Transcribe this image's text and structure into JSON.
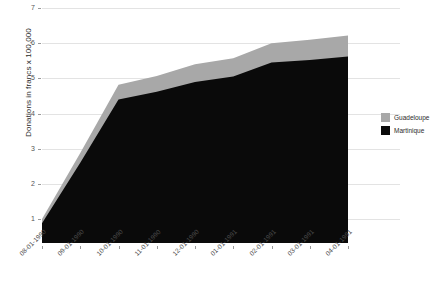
{
  "chart_data": {
    "type": "area",
    "stacked": true,
    "title": "",
    "xlabel": "",
    "ylabel": "Donations in francs x 100,000",
    "categories": [
      "08-01-1990",
      "09-01-1990",
      "10-01-1990",
      "11-01-1990",
      "12-01-1990",
      "01-01-1991",
      "02-01-1991",
      "03-01-1991",
      "04-01-1991"
    ],
    "yticks": [
      1,
      2,
      3,
      4,
      5,
      6,
      7
    ],
    "ylim": [
      0.32,
      7
    ],
    "grid": true,
    "legend_position": "right",
    "series": [
      {
        "name": "Guadeloupe",
        "color": "#a8a8a8",
        "values": [
          0.12,
          0.28,
          0.42,
          0.45,
          0.5,
          0.52,
          0.55,
          0.58,
          0.6
        ]
      },
      {
        "name": "Martinique",
        "color": "#0a0a0a",
        "values": [
          0.88,
          2.6,
          4.4,
          4.62,
          4.9,
          5.05,
          5.45,
          5.52,
          5.62
        ]
      }
    ],
    "totals": [
      1.0,
      2.88,
      4.82,
      5.07,
      5.4,
      5.57,
      6.0,
      6.1,
      6.22
    ]
  },
  "legend": {
    "items": [
      {
        "label": "Guadeloupe",
        "color": "#a8a8a8"
      },
      {
        "label": "Martinique",
        "color": "#0a0a0a"
      }
    ]
  },
  "axis": {
    "y_title": "Donations in francs x 100,000"
  }
}
